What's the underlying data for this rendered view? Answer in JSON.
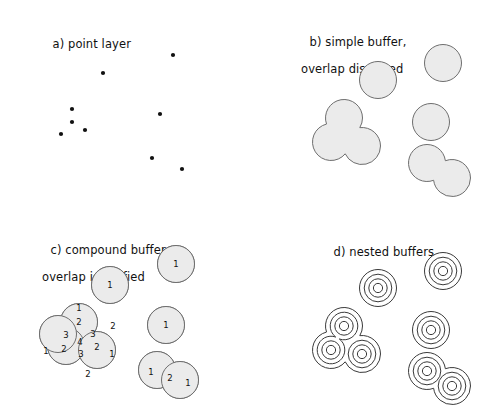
{
  "figure": {
    "width": 490,
    "height": 416,
    "background": "#ffffff",
    "style": {
      "buffer_fill": "#ebebeb",
      "buffer_stroke": "#6e6e6e",
      "ring_stroke": "#3a3a3a",
      "point_color": "#111111",
      "label_color": "#111111"
    }
  },
  "panels": [
    {
      "id": "a",
      "title_line1": "a) point layer",
      "title_line2": "",
      "title_x": 30,
      "title_y": 24,
      "kind": "points",
      "points": [
        {
          "id": "p1",
          "x": 173,
          "y": 55
        },
        {
          "id": "p2",
          "x": 103,
          "y": 73
        },
        {
          "id": "p3",
          "x": 72,
          "y": 109
        },
        {
          "id": "p4",
          "x": 72,
          "y": 122
        },
        {
          "id": "p5",
          "x": 85,
          "y": 130
        },
        {
          "id": "p6",
          "x": 61,
          "y": 134
        },
        {
          "id": "p7",
          "x": 160,
          "y": 114
        },
        {
          "id": "p8",
          "x": 152,
          "y": 158
        },
        {
          "id": "p9",
          "x": 182,
          "y": 169
        }
      ],
      "point_radius": 2.1
    },
    {
      "id": "b",
      "title_line1": "b) simple buffer,",
      "title_line2": "overlap dissolved",
      "title_x": 42,
      "title_y": 22,
      "kind": "dissolved-buffers",
      "buffer_radius": 18.5,
      "buffers": [
        {
          "id": "b1",
          "x": 198,
          "y": 63
        },
        {
          "id": "b2",
          "x": 133,
          "y": 80
        },
        {
          "id": "b3",
          "x": 99,
          "y": 118
        },
        {
          "id": "b4",
          "x": 86,
          "y": 142
        },
        {
          "id": "b5",
          "x": 117,
          "y": 146
        },
        {
          "id": "b6",
          "x": 186,
          "y": 122
        },
        {
          "id": "b7",
          "x": 182,
          "y": 163
        },
        {
          "id": "b8",
          "x": 207,
          "y": 178
        }
      ]
    },
    {
      "id": "c",
      "title_line1": "c) compound buffer,",
      "title_line2": "overlap identified",
      "title_x": 28,
      "title_y": 22,
      "kind": "compound-buffers",
      "buffer_radius": 18.5,
      "buffers": [
        {
          "id": "c1",
          "x": 176,
          "y": 56
        },
        {
          "id": "c2",
          "x": 110,
          "y": 77
        },
        {
          "id": "c3",
          "x": 166,
          "y": 117
        },
        {
          "id": "c4",
          "x": 79,
          "y": 114
        },
        {
          "id": "c5",
          "x": 66,
          "y": 138
        },
        {
          "id": "c6",
          "x": 97,
          "y": 142
        },
        {
          "id": "c7",
          "x": 58,
          "y": 126
        },
        {
          "id": "c8",
          "x": 157,
          "y": 162
        },
        {
          "id": "c9",
          "x": 180,
          "y": 172
        }
      ],
      "overlap_labels": [
        {
          "text": "1",
          "x": 176,
          "y": 56
        },
        {
          "text": "1",
          "x": 110,
          "y": 77
        },
        {
          "text": "1",
          "x": 166,
          "y": 117
        },
        {
          "text": "1",
          "x": 79,
          "y": 100
        },
        {
          "text": "2",
          "x": 79,
          "y": 114
        },
        {
          "text": "2",
          "x": 113,
          "y": 118
        },
        {
          "text": "3",
          "x": 66,
          "y": 127
        },
        {
          "text": "3",
          "x": 93,
          "y": 126
        },
        {
          "text": "4",
          "x": 80,
          "y": 134
        },
        {
          "text": "1",
          "x": 46,
          "y": 143
        },
        {
          "text": "2",
          "x": 64,
          "y": 141
        },
        {
          "text": "3",
          "x": 81,
          "y": 146
        },
        {
          "text": "2",
          "x": 97,
          "y": 139
        },
        {
          "text": "1",
          "x": 112,
          "y": 146
        },
        {
          "text": "2",
          "x": 88,
          "y": 166
        },
        {
          "text": "1",
          "x": 151,
          "y": 164
        },
        {
          "text": "2",
          "x": 170,
          "y": 170
        },
        {
          "text": "1",
          "x": 188,
          "y": 175
        }
      ]
    },
    {
      "id": "d",
      "title_line1": "d) nested buffers",
      "title_line2": "",
      "title_x": 66,
      "title_y": 24,
      "kind": "nested-buffers",
      "ring_radii": [
        18.5,
        13.8,
        9.2,
        4.6
      ],
      "buffers": [
        {
          "id": "d1",
          "x": 198,
          "y": 63
        },
        {
          "id": "d2",
          "x": 133,
          "y": 80
        },
        {
          "id": "d3",
          "x": 99,
          "y": 118
        },
        {
          "id": "d4",
          "x": 86,
          "y": 142
        },
        {
          "id": "d5",
          "x": 117,
          "y": 146
        },
        {
          "id": "d6",
          "x": 186,
          "y": 122
        },
        {
          "id": "d7",
          "x": 182,
          "y": 163
        },
        {
          "id": "d8",
          "x": 207,
          "y": 178
        }
      ]
    }
  ]
}
